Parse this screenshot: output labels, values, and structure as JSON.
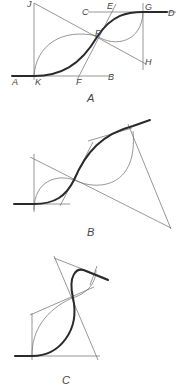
{
  "figure": {
    "panels": [
      {
        "caption": "A",
        "points": {
          "J": "J",
          "C": "C",
          "E": "E",
          "G": "G",
          "D": "D",
          "P": "P",
          "H": "H",
          "A": "A",
          "K": "K",
          "F": "F",
          "B": "B"
        }
      },
      {
        "caption": "B"
      },
      {
        "caption": "C"
      }
    ],
    "colors": {
      "construction_line": "#6a6a6a",
      "curve": "#2a2a2a",
      "label": "#444444"
    }
  }
}
